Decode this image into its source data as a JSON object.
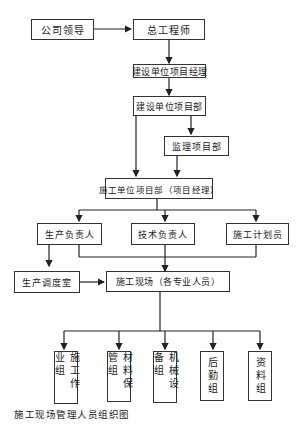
{
  "diagram": {
    "caption": "施工现场管理人员组织图",
    "nodes": {
      "company_leader": "公司领导",
      "chief_engineer": "总工程师",
      "owner_pm": "建设单位项目经理",
      "owner_dept": "建设单位项目部",
      "supervision_dept": "监理项目部",
      "contractor_dept": "施工单位项目部（项目经理）",
      "production_head": "生产负责人",
      "technical_head": "技术负责人",
      "planner": "施工计划员",
      "dispatch_room": "生产调度室",
      "site_staff": "施工现场（各专业人员）",
      "work_team": "施工作业组",
      "material_team": "材料保管组",
      "equipment_team": "机械设备组",
      "logistics_team": "后勤组",
      "document_team": "资料组"
    },
    "edges": [
      [
        "公司领导",
        "总工程师"
      ],
      [
        "总工程师",
        "建设单位项目经理"
      ],
      [
        "建设单位项目经理",
        "建设单位项目部"
      ],
      [
        "建设单位项目部",
        "监理项目部"
      ],
      [
        "建设单位项目部",
        "施工单位项目部（项目经理）"
      ],
      [
        "监理项目部",
        "施工单位项目部（项目经理）"
      ],
      [
        "施工单位项目部（项目经理）",
        "生产负责人"
      ],
      [
        "施工单位项目部（项目经理）",
        "技术负责人"
      ],
      [
        "施工单位项目部（项目经理）",
        "施工计划员"
      ],
      [
        "生产负责人",
        "生产调度室"
      ],
      [
        "生产负责人",
        "施工现场（各专业人员）"
      ],
      [
        "技术负责人",
        "施工现场（各专业人员）"
      ],
      [
        "施工计划员",
        "施工现场（各专业人员）"
      ],
      [
        "生产调度室",
        "施工现场（各专业人员）"
      ],
      [
        "施工现场（各专业人员）",
        "施工作业组"
      ],
      [
        "施工现场（各专业人员）",
        "材料保管组"
      ],
      [
        "施工现场（各专业人员）",
        "机械设备组"
      ],
      [
        "施工现场（各专业人员）",
        "后勤组"
      ],
      [
        "施工现场（各专业人员）",
        "资料组"
      ]
    ]
  }
}
